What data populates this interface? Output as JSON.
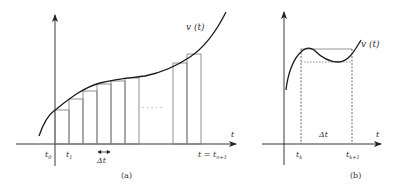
{
  "panel_a": {
    "curve_label": "v (t)",
    "axis_label": "t",
    "tick_labels": {
      "t0": "t",
      "t0_sub": "0",
      "t1": "t",
      "t1_sub": "1",
      "delta": "Δt",
      "tn": "t = t",
      "tn_sub": "n+1"
    },
    "ellipsis": "· · · · ·",
    "caption": "(a)"
  },
  "panel_b": {
    "curve_label": "v (t)",
    "axis_label": "t",
    "tick_labels": {
      "tk": "t",
      "tk_sub": "k",
      "tk1": "t",
      "tk1_sub": "k+1",
      "delta": "Δt"
    },
    "caption": "(b)"
  },
  "colors": {
    "axis": "#222222",
    "curve": "#1a1a1a",
    "rect": "#777777",
    "dashed": "#666666"
  }
}
